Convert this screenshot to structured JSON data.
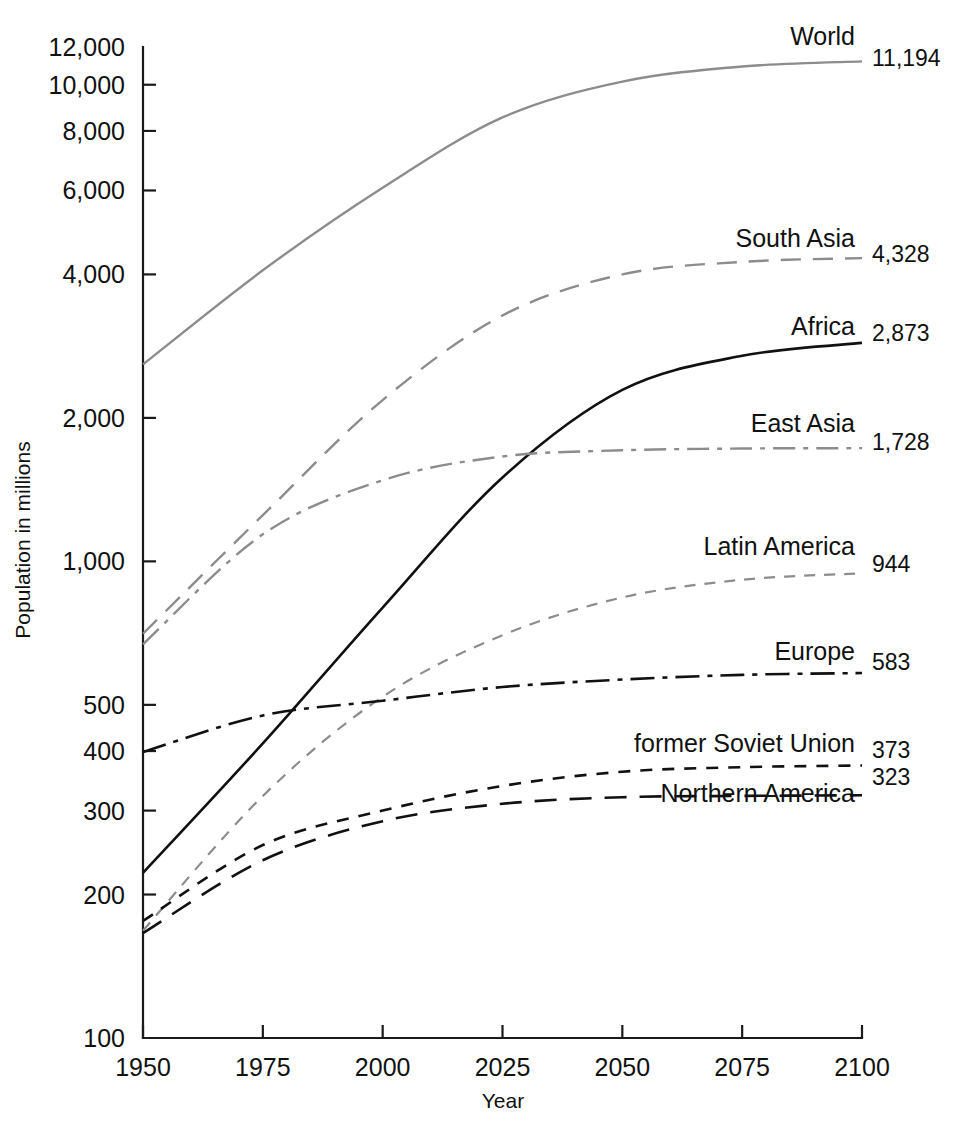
{
  "chart_data": {
    "type": "line",
    "title": "",
    "xlabel": "Year",
    "ylabel": "Population in millions",
    "yscale": "log",
    "ylim": [
      100,
      12000
    ],
    "xlim": [
      1950,
      2100
    ],
    "grid": false,
    "legend_position": "right-inline-labels",
    "x": [
      1950,
      1975,
      2000,
      2025,
      2050,
      2075,
      2100
    ],
    "y_ticks": [
      100,
      200,
      300,
      400,
      500,
      1000,
      2000,
      4000,
      6000,
      8000,
      10000,
      12000
    ],
    "y_tick_labels": [
      "100",
      "200",
      "300",
      "400",
      "500",
      "1,000",
      "2,000",
      "4,000",
      "6,000",
      "8,000",
      "10,000",
      "12,000"
    ],
    "x_ticks": [
      1950,
      1975,
      2000,
      2025,
      2050,
      2075,
      2100
    ],
    "x_tick_labels": [
      "1950",
      "1975",
      "2000",
      "2025",
      "2050",
      "2075",
      "2100"
    ],
    "series": [
      {
        "name": "World",
        "label": "World",
        "end_value_label": "11,194",
        "color": "#8c8c8c",
        "style": "solid",
        "dasharray": "none",
        "width": 2.4,
        "values": [
          2590,
          4080,
          6080,
          8540,
          10150,
          10920,
          11194
        ]
      },
      {
        "name": "South Asia",
        "label": "South Asia",
        "end_value_label": "4,328",
        "color": "#8c8c8c",
        "style": "long-dash",
        "dasharray": "20,12",
        "width": 2.4,
        "values": [
          705,
          1250,
          2180,
          3280,
          4000,
          4250,
          4328
        ]
      },
      {
        "name": "Africa",
        "label": "Africa",
        "end_value_label": "2,873",
        "color": "#111111",
        "style": "solid",
        "dasharray": "none",
        "width": 2.6,
        "values": [
          222,
          415,
          800,
          1500,
          2290,
          2700,
          2873
        ]
      },
      {
        "name": "East Asia",
        "label": "East Asia",
        "end_value_label": "1,728",
        "color": "#8c8c8c",
        "style": "dash-dot",
        "dasharray": "22,8,5,8",
        "width": 2.4,
        "values": [
          670,
          1140,
          1480,
          1660,
          1710,
          1725,
          1728
        ]
      },
      {
        "name": "Latin America",
        "label": "Latin America",
        "end_value_label": "944",
        "color": "#8c8c8c",
        "style": "short-dash",
        "dasharray": "11,9",
        "width": 2.2,
        "values": [
          168,
          322,
          520,
          700,
          840,
          915,
          944
        ]
      },
      {
        "name": "Europe",
        "label": "Europe",
        "end_value_label": "583",
        "color": "#111111",
        "style": "dash-dot",
        "dasharray": "24,8,5,8",
        "width": 2.6,
        "values": [
          398,
          475,
          510,
          545,
          565,
          578,
          583
        ]
      },
      {
        "name": "former Soviet Union",
        "label": "former Soviet Union",
        "end_value_label": "373",
        "color": "#111111",
        "style": "short-dash",
        "dasharray": "12,10",
        "width": 2.6,
        "values": [
          176,
          254,
          300,
          338,
          362,
          370,
          373
        ]
      },
      {
        "name": "Northern America",
        "label": "Northern America",
        "end_value_label": "323",
        "color": "#111111",
        "style": "long-dash",
        "dasharray": "22,13",
        "width": 2.6,
        "values": [
          166,
          236,
          285,
          310,
          320,
          322,
          323
        ]
      }
    ],
    "series_label_positions": [
      {
        "name": "World",
        "x": 855,
        "y": 45
      },
      {
        "name": "South Asia",
        "x": 855,
        "y": 247
      },
      {
        "name": "Africa",
        "x": 855,
        "y": 335
      },
      {
        "name": "East Asia",
        "x": 855,
        "y": 432
      },
      {
        "name": "Latin America",
        "x": 855,
        "y": 555
      },
      {
        "name": "Europe",
        "x": 855,
        "y": 660
      },
      {
        "name": "former Soviet Union",
        "x": 855,
        "y": 752
      },
      {
        "name": "Northern America",
        "x": 855,
        "y": 802
      }
    ],
    "end_value_positions": [
      {
        "name": "World",
        "x": 872,
        "y": 66
      },
      {
        "name": "South Asia",
        "x": 872,
        "y": 262
      },
      {
        "name": "Africa",
        "x": 872,
        "y": 341
      },
      {
        "name": "East Asia",
        "x": 872,
        "y": 450
      },
      {
        "name": "Latin America",
        "x": 872,
        "y": 572
      },
      {
        "name": "Europe",
        "x": 872,
        "y": 670
      },
      {
        "name": "former Soviet Union",
        "x": 872,
        "y": 758
      },
      {
        "name": "Northern America",
        "x": 872,
        "y": 785
      }
    ]
  }
}
